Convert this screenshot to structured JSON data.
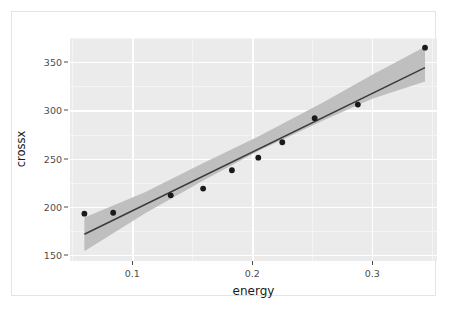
{
  "chart_data": {
    "type": "scatter",
    "title": "",
    "xlabel": "energy",
    "ylabel": "crossx",
    "xlim": [
      0.048,
      0.354
    ],
    "ylim": [
      144,
      375
    ],
    "grid": true,
    "legend": false,
    "x_ticks": [
      0.1,
      0.2,
      0.3
    ],
    "x_tick_labels": [
      "0.1",
      "0.2",
      "0.3"
    ],
    "y_ticks": [
      150,
      200,
      250,
      300,
      350
    ],
    "y_tick_labels": [
      "150",
      "200",
      "250",
      "300",
      "350"
    ],
    "x_minor_ticks": [
      0.05,
      0.15,
      0.25,
      0.35
    ],
    "y_minor_ticks": [
      175,
      225,
      275,
      325,
      375
    ],
    "points": [
      {
        "x": 0.06,
        "y": 193
      },
      {
        "x": 0.084,
        "y": 194
      },
      {
        "x": 0.132,
        "y": 212
      },
      {
        "x": 0.159,
        "y": 219
      },
      {
        "x": 0.183,
        "y": 238
      },
      {
        "x": 0.205,
        "y": 251
      },
      {
        "x": 0.225,
        "y": 267
      },
      {
        "x": 0.252,
        "y": 292
      },
      {
        "x": 0.288,
        "y": 306
      },
      {
        "x": 0.344,
        "y": 365
      }
    ],
    "fit": {
      "type": "linear-regression",
      "intercept": 135.2,
      "slope": 608.0,
      "x_start": 0.06,
      "x_end": 0.344,
      "y_start": 171.7,
      "y_end": 344.3
    },
    "confidence_band": {
      "level": 0.95,
      "lower": [
        {
          "x": 0.06,
          "y": 154.0
        },
        {
          "x": 0.11,
          "y": 193.0
        },
        {
          "x": 0.16,
          "y": 228.0
        },
        {
          "x": 0.205,
          "y": 258.0
        },
        {
          "x": 0.26,
          "y": 290.0
        },
        {
          "x": 0.3,
          "y": 312.0
        },
        {
          "x": 0.344,
          "y": 330.0
        }
      ],
      "upper": [
        {
          "x": 0.06,
          "y": 189.0
        },
        {
          "x": 0.11,
          "y": 215.0
        },
        {
          "x": 0.16,
          "y": 246.0
        },
        {
          "x": 0.205,
          "y": 273.0
        },
        {
          "x": 0.26,
          "y": 309.0
        },
        {
          "x": 0.3,
          "y": 337.0
        },
        {
          "x": 0.344,
          "y": 366.0
        }
      ]
    },
    "colors": {
      "panel_background": "#ebebeb",
      "gridline_major": "#ffffff",
      "gridline_minor": "#f4f4f4",
      "point": "#1a1a1a",
      "line": "#3c3c3c",
      "band": "#bfbfbf",
      "axis_text": "#4d4d4d",
      "axis_title": "#1a1a1a",
      "figure_background": "#ffffff"
    }
  }
}
